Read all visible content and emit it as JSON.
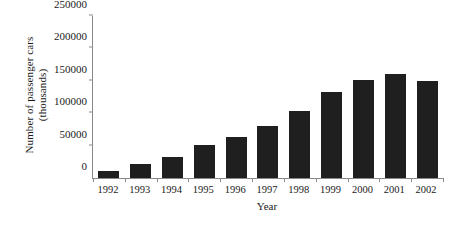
{
  "chart_data": {
    "type": "bar",
    "title": "",
    "xlabel": "Year",
    "ylabel": "Number of passenger cars (thousands)",
    "ylabel_line1": "Number of passenger cars",
    "ylabel_line2": "(thousands)",
    "categories": [
      "1992",
      "1993",
      "1994",
      "1995",
      "1996",
      "1997",
      "1998",
      "1999",
      "2000",
      "2001",
      "2002"
    ],
    "values": [
      11000,
      22000,
      32000,
      51000,
      63000,
      80000,
      103000,
      132000,
      151000,
      160000,
      150000
    ],
    "ylim": [
      0,
      250000
    ],
    "yticks": [
      0,
      50000,
      100000,
      150000,
      200000,
      250000
    ],
    "ytick_labels": [
      "0",
      "50000",
      "100000",
      "150000",
      "200000",
      "250000"
    ],
    "grid": false,
    "legend": false,
    "bar_color": "#1f1f1f",
    "axis_color": "#8a8a8a",
    "background_color": "#ffffff"
  }
}
